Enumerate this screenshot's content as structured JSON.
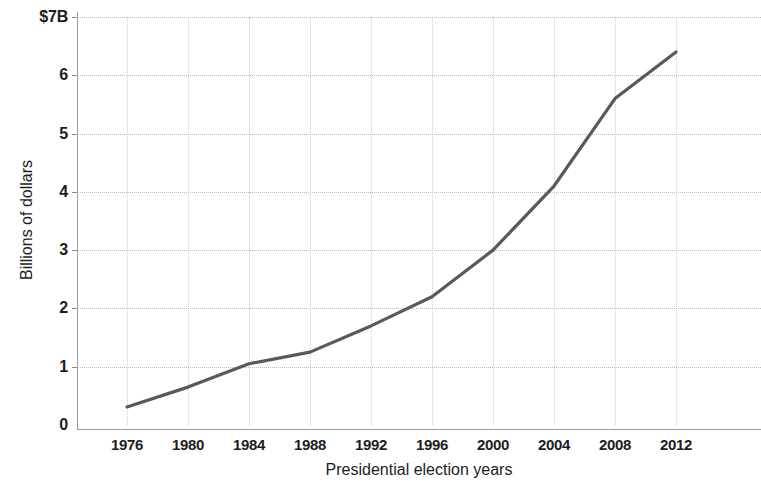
{
  "chart_data": {
    "type": "line",
    "title": "",
    "xlabel": "Presidential election years",
    "ylabel": "Billions of dollars",
    "categories": [
      "1976",
      "1980",
      "1984",
      "1988",
      "1992",
      "1996",
      "2000",
      "2004",
      "2008",
      "2012"
    ],
    "x": [
      1976,
      1980,
      1984,
      1988,
      1992,
      1996,
      2000,
      2004,
      2008,
      2012
    ],
    "values": [
      0.31,
      0.65,
      1.05,
      1.25,
      1.7,
      2.2,
      3.0,
      4.1,
      5.6,
      6.4
    ],
    "series": [
      {
        "name": "Total spending",
        "values": [
          0.31,
          0.65,
          1.05,
          1.25,
          1.7,
          2.2,
          3.0,
          4.1,
          5.6,
          6.4
        ]
      }
    ],
    "ylim": [
      0,
      7
    ],
    "xlim": [
      1976,
      2012
    ],
    "yticks": [
      0,
      1,
      2,
      3,
      4,
      5,
      6,
      7
    ],
    "ytick_labels": [
      "0",
      "1",
      "2",
      "3",
      "4",
      "5",
      "6",
      "$7B"
    ],
    "xtick_labels": [
      "1976",
      "1980",
      "1984",
      "1988",
      "1992",
      "1996",
      "2000",
      "2004",
      "2008",
      "2012"
    ],
    "grid": true,
    "grid_style": "dotted",
    "legend": "none",
    "line_color": "#595959",
    "grid_color": "#c4c4c4",
    "axis_color": "#9a9a9a",
    "background": "#ffffff",
    "units": "Billions of dollars"
  }
}
